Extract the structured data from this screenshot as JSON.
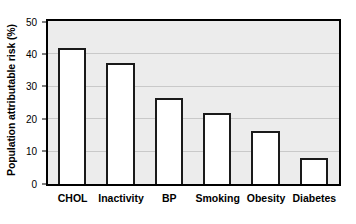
{
  "chart_data": {
    "type": "bar",
    "title": "",
    "subtitle": "",
    "xlabel": "",
    "ylabel": "Population attributable risk (%)",
    "categories": [
      "CHOL",
      "Inactivity",
      "BP",
      "Smoking",
      "Obesity",
      "Diabetes"
    ],
    "values": [
      42,
      37.3,
      26.5,
      21.8,
      16.5,
      8
    ],
    "ylim": [
      0,
      50
    ],
    "yticks": [
      0,
      10,
      20,
      30,
      40,
      50
    ],
    "ytick_labels": [
      "0",
      "10",
      "20",
      "30",
      "40",
      "50"
    ],
    "gridlines": [
      10,
      20,
      30,
      40
    ],
    "grid": true,
    "legend": null,
    "legend_position": "none",
    "series": [
      {
        "name": "Population attributable risk",
        "values": [
          42,
          37.3,
          26.5,
          21.8,
          16.5,
          8
        ]
      }
    ],
    "colors": {
      "bar_fill": "#ffffff",
      "bar_edge": "#1a1a1a",
      "plot_background": "#ececec",
      "grid_color": "#c9c9c9",
      "axis_color": "#000000",
      "figure_background": "#ffffff",
      "text_color": "#000000"
    }
  }
}
